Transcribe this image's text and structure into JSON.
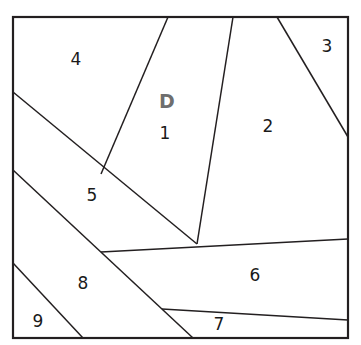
{
  "figure": {
    "name": "partitioned-square-diagram",
    "background_color": "#ffffff",
    "line_color": "#231f20",
    "frame": {
      "x": 13,
      "y": 17,
      "width": 335,
      "height": 321,
      "stroke_width": 2.2
    }
  },
  "marker": {
    "text": "D",
    "color": "#6e6e6e",
    "x": 167,
    "y": 102,
    "font_size": 19,
    "bold": true
  },
  "regions": [
    {
      "id": "region-1",
      "label": "1",
      "label_x": 165,
      "label_y": 134,
      "points": "168,17 233,17 225,119 197,244 101,174"
    },
    {
      "id": "region-2",
      "label": "2",
      "label_x": 268,
      "label_y": 127,
      "points": "233,17 277,17 348,137 348,239 197,244"
    },
    {
      "id": "region-3",
      "label": "3",
      "label_x": 327,
      "label_y": 47,
      "points": "277,17 348,17 348,137"
    },
    {
      "id": "region-4",
      "label": "4",
      "label_x": 76,
      "label_y": 60,
      "points": "13,17 168,17 101,174 13,92"
    },
    {
      "id": "region-5",
      "label": "5",
      "label_x": 92,
      "label_y": 196,
      "points": "13,92 101,174 197,244 101,252 13,170"
    },
    {
      "id": "region-6",
      "label": "6",
      "label_x": 255,
      "label_y": 276,
      "points": "101,252 197,244 348,239 348,320 162,309"
    },
    {
      "id": "region-7",
      "label": "7",
      "label_x": 219,
      "label_y": 325,
      "points": "162,309 348,320 348,338 193,338"
    },
    {
      "id": "region-8",
      "label": "8",
      "label_x": 83,
      "label_y": 284,
      "points": "13,170 101,252 193,338 83,338 13,263"
    },
    {
      "id": "region-9",
      "label": "9",
      "label_x": 38,
      "label_y": 322,
      "points": "13,263 83,338 13,338"
    }
  ],
  "edges": [
    {
      "name": "edge-top-to-1-4",
      "x1": 168,
      "y1": 17,
      "x2": 101,
      "y2": 174,
      "stroke_width": 1.5
    },
    {
      "name": "edge-1-2-divider",
      "x1": 233,
      "y1": 17,
      "x2": 197,
      "y2": 244,
      "stroke_width": 1.5
    },
    {
      "name": "edge-2-3-divider",
      "x1": 277,
      "y1": 17,
      "x2": 348,
      "y2": 137,
      "stroke_width": 1.5
    },
    {
      "name": "edge-4-5-divider",
      "x1": 13,
      "y1": 92,
      "x2": 197,
      "y2": 244,
      "stroke_width": 1.5
    },
    {
      "name": "edge-5-8-divider",
      "x1": 13,
      "y1": 170,
      "x2": 193,
      "y2": 338,
      "stroke_width": 1.5
    },
    {
      "name": "edge-8-9-divider",
      "x1": 13,
      "y1": 263,
      "x2": 83,
      "y2": 338,
      "stroke_width": 1.5
    },
    {
      "name": "edge-6-top-boundary",
      "x1": 101,
      "y1": 252,
      "x2": 348,
      "y2": 239,
      "stroke_width": 1.5
    },
    {
      "name": "edge-6-7-divider",
      "x1": 162,
      "y1": 309,
      "x2": 348,
      "y2": 320,
      "stroke_width": 1.5
    }
  ]
}
